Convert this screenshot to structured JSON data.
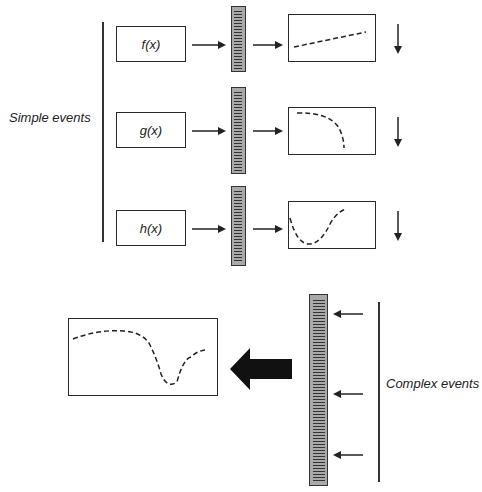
{
  "simple_events": {
    "label": "Simple events",
    "rows": [
      {
        "function": "f(x)",
        "output_curve": "rising-linear"
      },
      {
        "function": "g(x)",
        "output_curve": "decaying-curve"
      },
      {
        "function": "h(x)",
        "output_curve": "dip-then-rise"
      }
    ]
  },
  "complex_events": {
    "label": "Complex events",
    "output_curve": "flat-then-dip-then-recover",
    "input_arrows": 3
  },
  "icons": {
    "small_arrow": "arrow-right",
    "down_arrow": "arrow-down",
    "big_arrow": "bold-arrow-left",
    "input_arrow": "arrow-left",
    "ruler": "spectrum-bar"
  },
  "colors": {
    "line": "#2a2a2a",
    "ruler_fill": "#a9a9a9",
    "background": "#ffffff"
  }
}
